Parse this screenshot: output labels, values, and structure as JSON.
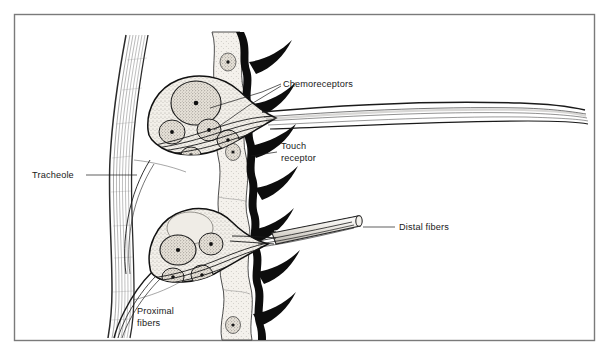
{
  "figure": {
    "name": "insect-sensory-neuron-diagram",
    "background_color": "#ffffff",
    "border_color": "#7a7a7a",
    "ink_color": "#1a1a1a",
    "cuticle_color": "#000000",
    "epidermis_fill": "#ebe7e0",
    "ganglion_fill": "#f0ece5",
    "nucleus_fill": "#e4dfd6"
  },
  "labels": {
    "chemoreceptors": "Chemoreceptors",
    "touch_receptor_line1": "Touch",
    "touch_receptor_line2": "receptor",
    "tracheole": "Tracheole",
    "distal_fibers": "Distal fibers",
    "proximal_fibers_line1": "Proximal",
    "proximal_fibers_line2": "fibers"
  },
  "structures": {
    "upper_ganglion": "upper-sensory-neuron-cluster",
    "lower_ganglion": "lower-sensory-neuron-cluster",
    "cuticle_band": "cuticle-with-spines",
    "spine_count": 7,
    "tracheole_bundle": "vertical-tracheole-bundle",
    "distal_fiber_sheath": "distal-fiber-sheath-tube",
    "long_fiber_bundle": "chemoreceptor-axon-bundle"
  }
}
